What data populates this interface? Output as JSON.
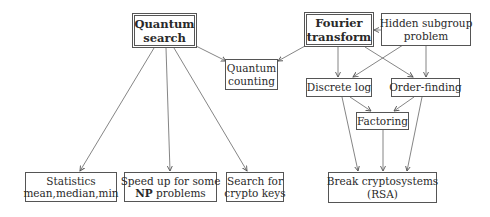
{
  "diagram": {
    "nodes": {
      "quantum_search": {
        "lines": [
          "Quantum",
          "search"
        ],
        "emphasis": "double-border-bold"
      },
      "fourier_transform": {
        "lines": [
          "Fourier",
          "transform"
        ],
        "emphasis": "double-border-bold"
      },
      "hidden_subgroup": {
        "lines": [
          "Hidden subgroup",
          "problem"
        ]
      },
      "quantum_counting": {
        "lines": [
          "Quantum",
          "counting"
        ]
      },
      "discrete_log": {
        "lines": [
          "Discrete log"
        ]
      },
      "order_finding": {
        "lines": [
          "Order-finding"
        ]
      },
      "factoring": {
        "lines": [
          "Factoring"
        ]
      },
      "statistics": {
        "lines": [
          "Statistics",
          "mean,median,min"
        ]
      },
      "speedup_np": {
        "line1": "Speed up for some",
        "line2_bold": "NP",
        "line2_rest": " problems"
      },
      "crypto_search": {
        "lines": [
          "Search for",
          "crypto keys"
        ]
      },
      "break_crypto": {
        "lines": [
          "Break cryptosystems",
          "(RSA)"
        ]
      }
    },
    "edges": [
      {
        "from": "Quantum search",
        "to": "Quantum counting"
      },
      {
        "from": "Fourier transform",
        "to": "Quantum counting"
      },
      {
        "from": "Quantum search",
        "to": "Statistics"
      },
      {
        "from": "Quantum search",
        "to": "Speed up for some NP problems"
      },
      {
        "from": "Quantum search",
        "to": "Search for crypto keys"
      },
      {
        "from": "Hidden subgroup problem",
        "to": "Fourier transform"
      },
      {
        "from": "Fourier transform",
        "to": "Discrete log"
      },
      {
        "from": "Fourier transform",
        "to": "Order-finding"
      },
      {
        "from": "Hidden subgroup problem",
        "to": "Discrete log"
      },
      {
        "from": "Hidden subgroup problem",
        "to": "Order-finding"
      },
      {
        "from": "Discrete log",
        "to": "Factoring"
      },
      {
        "from": "Order-finding",
        "to": "Factoring"
      },
      {
        "from": "Discrete log",
        "to": "Break cryptosystems (RSA)"
      },
      {
        "from": "Factoring",
        "to": "Break cryptosystems (RSA)"
      },
      {
        "from": "Order-finding",
        "to": "Break cryptosystems (RSA)"
      }
    ],
    "colors": {
      "stroke": "#555555",
      "text": "#2a2a2a",
      "background": "#ffffff"
    }
  }
}
